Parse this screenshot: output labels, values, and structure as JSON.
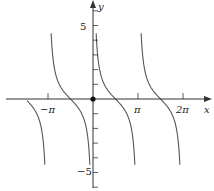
{
  "chart_data": {
    "type": "line",
    "title": "",
    "function": "y = cot(x)",
    "xlabel": "x",
    "ylabel": "y",
    "x_ticks": [
      {
        "value": -3.14159,
        "label": "−π"
      },
      {
        "value": 3.14159,
        "label": "π"
      },
      {
        "value": 6.28318,
        "label": "2π"
      }
    ],
    "y_ticks": [
      {
        "value": 5,
        "label": "5"
      },
      {
        "value": -5,
        "label": "−5"
      }
    ],
    "xlim": [
      -4.6,
      8.0
    ],
    "ylim": [
      -5.5,
      6.2
    ],
    "asymptotes_x": [
      -3.14159,
      0,
      3.14159,
      6.28318
    ],
    "zeros_x": [
      -4.712,
      -1.571,
      1.571,
      4.712
    ],
    "origin_marker": true,
    "grid": false,
    "line_color": "#555555"
  },
  "labels": {
    "x_axis": "x",
    "y_axis": "y",
    "neg_pi": "−π",
    "pi": "π",
    "two_pi": "2π",
    "y5": "5",
    "yneg5": "−5"
  }
}
